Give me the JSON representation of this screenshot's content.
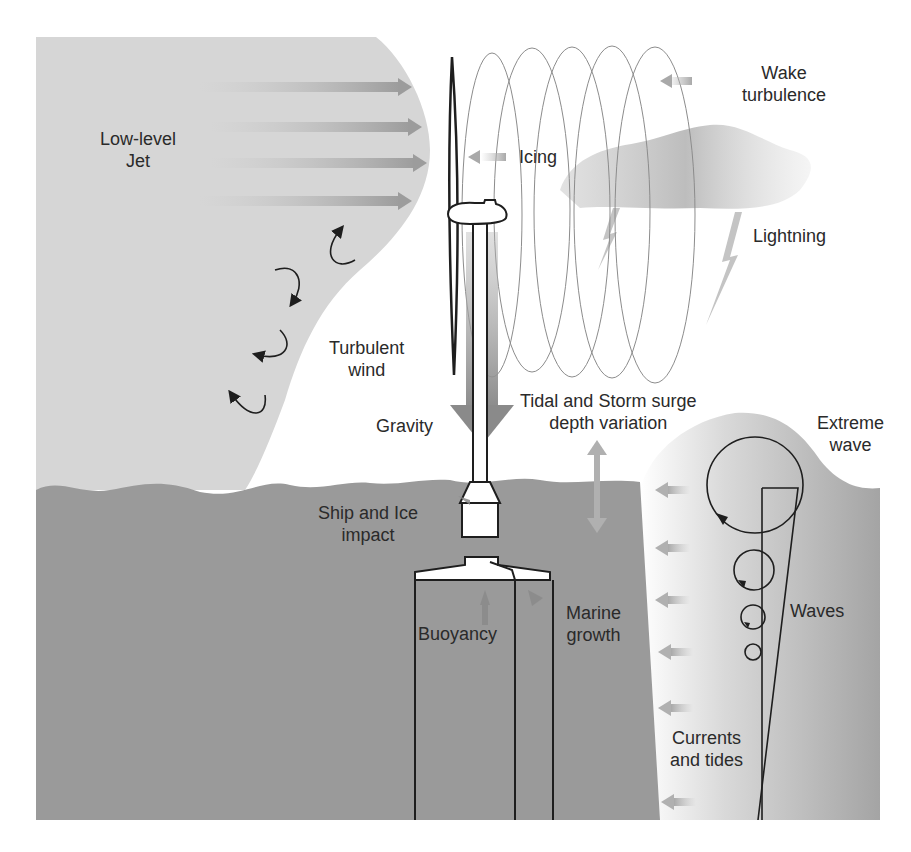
{
  "figure": {
    "colors": {
      "air_shade": "#d6d6d6",
      "sea": "#9a9a9a",
      "wave_region": "#c8c8c8",
      "arrow": "#a8a8a8",
      "outline": "#1e1e1e",
      "text": "#2a2a2a"
    },
    "labels": {
      "low_level_jet": [
        "Low-level",
        "Jet"
      ],
      "wake_turbulence": [
        "Wake",
        "turbulence"
      ],
      "icing": "Icing",
      "lightning": "Lightning",
      "turbulent_wind": [
        "Turbulent",
        "wind"
      ],
      "gravity": "Gravity",
      "tidal_surge": [
        "Tidal and Storm surge",
        "depth variation"
      ],
      "extreme_wave": [
        "Extreme",
        "wave"
      ],
      "ship_ice_impact": [
        "Ship and Ice",
        "impact"
      ],
      "buoyancy": "Buoyancy",
      "marine_growth": [
        "Marine",
        "growth"
      ],
      "waves": "Waves",
      "currents_tides": [
        "Currents",
        "and tides"
      ]
    }
  }
}
